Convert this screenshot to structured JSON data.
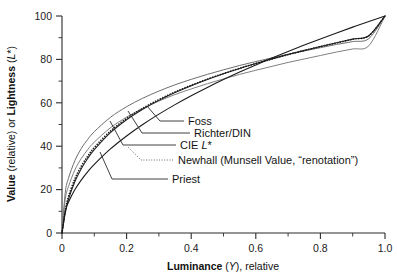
{
  "chart_data": {
    "type": "line",
    "title": "",
    "xlabel": "Luminance (Y), relative",
    "xlabel_parts": {
      "bold": "Luminance",
      "rest": " (Y), relative",
      "italic_token": "Y"
    },
    "ylabel": "Value (relative) or Lightness (L*)",
    "ylabel_parts": {
      "bold1": "Value",
      "mid1": " (relative) or ",
      "bold2": "Lightness",
      "mid2": " (",
      "italic_token": "L",
      "tail": "*)"
    },
    "xlim": [
      0,
      1.0
    ],
    "ylim": [
      0,
      100
    ],
    "x_ticks": [
      "0",
      "0.2",
      "0.4",
      "0.6",
      "0.8",
      "1.0"
    ],
    "x_tick_values": [
      0,
      0.2,
      0.4,
      0.6,
      0.8,
      1.0
    ],
    "x_minor_count_between": 1,
    "y_ticks": [
      "0",
      "20",
      "40",
      "60",
      "80",
      "100"
    ],
    "y_tick_values": [
      0,
      20,
      40,
      60,
      80,
      100
    ],
    "y_minor_count_between": 1,
    "grid": false,
    "legend_position": "inline-leader-labels",
    "x": [
      0,
      0.01,
      0.02,
      0.04,
      0.06,
      0.08,
      0.1,
      0.15,
      0.2,
      0.25,
      0.3,
      0.35,
      0.4,
      0.45,
      0.5,
      0.55,
      0.6,
      0.65,
      0.7,
      0.75,
      0.8,
      0.85,
      0.9,
      0.95,
      1.0
    ],
    "series": [
      {
        "name": "Foss",
        "style": "solid",
        "color": "#6e6e6e",
        "width": 1.0,
        "values": [
          0,
          18.5,
          25.2,
          33.4,
          39.0,
          43.2,
          46.7,
          53.3,
          58.2,
          62.1,
          65.4,
          68.3,
          70.8,
          73.1,
          75.2,
          77.2,
          79.0,
          80.7,
          82.4,
          83.9,
          85.4,
          86.9,
          88.2,
          89.6,
          100
        ]
      },
      {
        "name": "Richter/DIN",
        "style": "solid",
        "color": "#808080",
        "width": 1.0,
        "values": [
          0,
          15.4,
          21.4,
          29.1,
          34.4,
          38.5,
          41.9,
          48.5,
          53.4,
          57.4,
          60.8,
          63.8,
          66.4,
          68.8,
          71.0,
          73.1,
          75.0,
          76.8,
          78.6,
          80.2,
          81.8,
          83.4,
          84.8,
          86.3,
          100
        ]
      },
      {
        "name": "CIE L*",
        "style": "solid",
        "color": "#222222",
        "width": 1.1,
        "values": [
          0,
          8.99,
          15.49,
          23.74,
          29.72,
          34.47,
          38.44,
          46.26,
          52.19,
          57.02,
          61.12,
          64.7,
          67.88,
          70.76,
          73.4,
          75.84,
          78.11,
          80.24,
          82.25,
          84.15,
          85.96,
          87.68,
          89.34,
          90.93,
          100
        ]
      },
      {
        "name": "Newhall (Munsell Value, \"renotation\")",
        "style": "dotted",
        "color": "#1a1a1a",
        "width": 1.6,
        "values": [
          0,
          10.2,
          16.8,
          25.0,
          30.9,
          35.5,
          39.4,
          47.0,
          52.8,
          57.5,
          61.5,
          65.0,
          68.1,
          70.9,
          73.5,
          75.9,
          78.1,
          80.2,
          82.2,
          84.1,
          85.9,
          87.6,
          89.3,
          90.9,
          100
        ]
      },
      {
        "name": "Priest",
        "style": "solid",
        "color": "#1a1a1a",
        "width": 1.1,
        "values": [
          0,
          10.0,
          14.14,
          20.0,
          24.49,
          28.28,
          31.62,
          38.73,
          44.72,
          50.0,
          54.77,
          59.16,
          63.25,
          67.08,
          70.71,
          74.16,
          77.46,
          80.62,
          83.67,
          86.6,
          89.44,
          92.2,
          94.87,
          97.47,
          100
        ]
      }
    ],
    "annotations": [
      {
        "label": "Foss",
        "for_series": "Foss"
      },
      {
        "label": "Richter/DIN",
        "for_series": "Richter/DIN"
      },
      {
        "label": "CIE L*",
        "for_series": "CIE L*"
      },
      {
        "label": "Newhall (Munsell Value, \"renotation\")",
        "for_series": "Newhall (Munsell Value, \"renotation\")"
      },
      {
        "label": "Priest",
        "for_series": "Priest"
      }
    ]
  },
  "labels": {
    "foss": "Foss",
    "richter": "Richter/DIN",
    "cie_prefix": "CIE ",
    "cie_italic": "L",
    "cie_suffix": "*",
    "newhall": "Newhall (Munsell Value, “renotation”)",
    "priest": "Priest"
  },
  "axes": {
    "x_title_bold": "Luminance",
    "x_title_mid": " (",
    "x_title_italic": "Y",
    "x_title_tail": "), relative",
    "y_title_bold1": "Value",
    "y_title_mid1": " (relative) or ",
    "y_title_bold2": "Lightness",
    "y_title_mid2": " (",
    "y_title_italic": "L",
    "y_title_tail": "*)",
    "x_tick_0": "0",
    "x_tick_1": "0.2",
    "x_tick_2": "0.4",
    "x_tick_3": "0.6",
    "x_tick_4": "0.8",
    "x_tick_5": "1.0",
    "y_tick_0": "0",
    "y_tick_1": "20",
    "y_tick_2": "40",
    "y_tick_3": "60",
    "y_tick_4": "80",
    "y_tick_5": "100"
  },
  "colors": {
    "background": "#ffffff",
    "axis": "#2b2b2b",
    "text": "#1a1a1a",
    "curve_dark": "#1a1a1a",
    "curve_gray": "#7a7a7a"
  }
}
